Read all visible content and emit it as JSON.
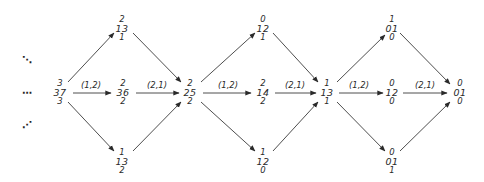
{
  "diagram": {
    "ellipsis": {
      "upper": "⋱",
      "middle": "⋯",
      "lower": "⋰"
    },
    "nodes": {
      "start": {
        "top": "3",
        "mid": "37",
        "bot": "3"
      },
      "d1_top": {
        "top": "2",
        "mid": "13",
        "bot": "1"
      },
      "d1_mid": {
        "top": "2",
        "mid": "36",
        "bot": "2"
      },
      "d1_bot": {
        "top": "1",
        "mid": "13",
        "bot": "2"
      },
      "join1": {
        "top": "2",
        "mid": "25",
        "bot": "2"
      },
      "d2_top": {
        "top": "0",
        "mid": "12",
        "bot": "1"
      },
      "d2_mid": {
        "top": "2",
        "mid": "14",
        "bot": "2"
      },
      "d2_bot": {
        "top": "1",
        "mid": "12",
        "bot": "0"
      },
      "join2": {
        "top": "1",
        "mid": "13",
        "bot": "1"
      },
      "d3_top": {
        "top": "1",
        "mid": "01",
        "bot": "0"
      },
      "d3_mid": {
        "top": "0",
        "mid": "12",
        "bot": "0"
      },
      "d3_bot": {
        "top": "0",
        "mid": "01",
        "bot": "1"
      },
      "end": {
        "top": "0",
        "mid": "01",
        "bot": "0"
      }
    },
    "edge_labels": {
      "e1": "(1,2)",
      "e2": "(2,1)",
      "e3": "(1,2)",
      "e4": "(2,1)",
      "e5": "(1,2)",
      "e6": "(2,1)"
    },
    "colors": {
      "line": "#3a3a3a",
      "text": "#2a2a2a",
      "background": "#ffffff"
    }
  }
}
